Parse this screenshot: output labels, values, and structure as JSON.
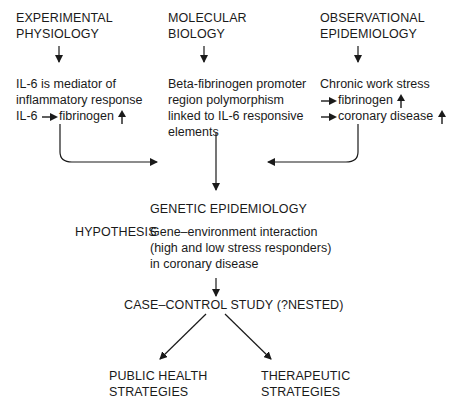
{
  "diagram": {
    "columns": [
      {
        "heading": [
          "EXPERIMENTAL",
          "PHYSIOLOGY"
        ],
        "finding": [
          "IL-6 is mediator of",
          "inflammatory response"
        ],
        "relation": {
          "from": "IL-6",
          "to": "fibrinogen",
          "direction": "up"
        }
      },
      {
        "heading": [
          "MOLECULAR",
          "BIOLOGY"
        ],
        "finding": [
          "Beta-fibrinogen promoter",
          "region polymorphism",
          "linked to IL-6 responsive",
          "elements"
        ]
      },
      {
        "heading": [
          "OBSERVATIONAL",
          "EPIDEMIOLOGY"
        ],
        "finding": [
          "Chronic work stress"
        ],
        "effects": [
          {
            "label": "fibrinogen",
            "direction": "up"
          },
          {
            "label": "coronary disease",
            "direction": "up"
          }
        ]
      }
    ],
    "convergence": {
      "title": "GENETIC EPIDEMIOLOGY",
      "hypothesis_label": "HYPOTHESIS",
      "hypothesis_text": [
        "Gene–environment interaction",
        "(high and low stress responders)",
        "in coronary disease"
      ]
    },
    "study": "CASE–CONTROL STUDY (?NESTED)",
    "outcomes": [
      [
        "PUBLIC HEALTH",
        "STRATEGIES"
      ],
      [
        "THERAPEUTIC",
        "STRATEGIES"
      ]
    ],
    "icons": {
      "flow_arrow": "arrow-down",
      "leads_to": "arrow-right",
      "increase": "arrow-up"
    }
  }
}
